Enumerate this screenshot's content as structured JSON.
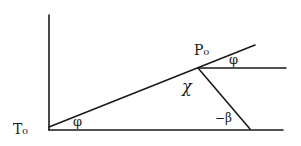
{
  "diagram": {
    "labels": {
      "origin": "T₀",
      "angle_bottom": "φ",
      "point_top": "P₀",
      "angle_top": "φ",
      "angle_chi": "χ",
      "angle_beta": "−β"
    },
    "stroke_color": "#1a1a1a",
    "background": "#ffffff"
  }
}
